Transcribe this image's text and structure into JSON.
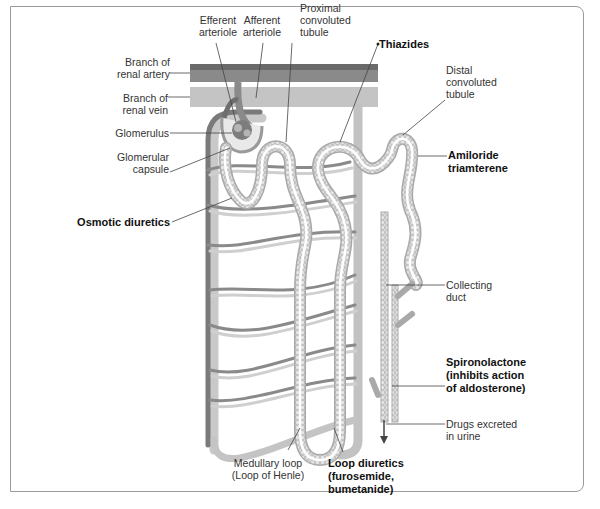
{
  "figure": {
    "colors": {
      "artery": "#6e6e6e",
      "vein": "#bdbdbd",
      "tubule_fill": "#e6e6e6",
      "tubule_edge": "#a8a8a8",
      "leader": "#444444",
      "frame": "#9a9a9a"
    }
  },
  "labels": {
    "efferent": [
      "Efferent",
      "arteriole"
    ],
    "afferent": [
      "Afferent",
      "arteriole"
    ],
    "proximal": [
      "Proximal",
      "convoluted",
      "tubule"
    ],
    "thiazides": "Thiazides",
    "distal": [
      "Distal",
      "convoluted",
      "tubule"
    ],
    "artery": [
      "Branch of",
      "renal artery"
    ],
    "vein": [
      "Branch of",
      "renal vein"
    ],
    "glomerulus": "Glomerulus",
    "capsule": [
      "Glomerular",
      "capsule"
    ],
    "amiloride": [
      "Amiloride",
      "triamterene"
    ],
    "osmotic": "Osmotic diuretics",
    "collecting": [
      "Collecting",
      "duct"
    ],
    "spironolactone": [
      "Spironolactone",
      "(inhibits action",
      "of aldosterone)"
    ],
    "excreted": [
      "Drugs excreted",
      "in urine"
    ],
    "medullary": [
      "Medullary loop",
      "(Loop of Henle)"
    ],
    "loop_diuretics": [
      "Loop diuretics",
      "(furosemide,",
      "bumetanide)"
    ]
  }
}
